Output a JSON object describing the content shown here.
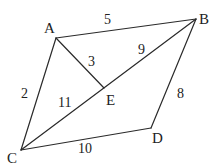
{
  "diagram": {
    "type": "geometry",
    "points": {
      "A": {
        "label": "A",
        "x": 56,
        "y": 38,
        "lx": 44,
        "ly": 33
      },
      "B": {
        "label": "B",
        "x": 196,
        "y": 19,
        "lx": 199,
        "ly": 24
      },
      "C": {
        "label": "C",
        "x": 21,
        "y": 150,
        "lx": 7,
        "ly": 163
      },
      "D": {
        "label": "D",
        "x": 151,
        "y": 128,
        "lx": 152,
        "ly": 143
      },
      "E": {
        "label": "E",
        "x": 104,
        "y": 88,
        "lx": 106,
        "ly": 105
      }
    },
    "edges": [
      {
        "from": "A",
        "to": "B",
        "length": "5",
        "lx": 104,
        "ly": 24
      },
      {
        "from": "A",
        "to": "C",
        "length": "2",
        "lx": 21,
        "ly": 98
      },
      {
        "from": "A",
        "to": "E",
        "length": "3",
        "lx": 88,
        "ly": 66
      },
      {
        "from": "B",
        "to": "E",
        "length": "9",
        "lx": 138,
        "ly": 54
      },
      {
        "from": "C",
        "to": "E",
        "length": "11",
        "lx": 58,
        "ly": 107
      },
      {
        "from": "B",
        "to": "D",
        "length": "8",
        "lx": 177,
        "ly": 98
      },
      {
        "from": "C",
        "to": "D",
        "length": "10",
        "lx": 78,
        "ly": 153
      }
    ]
  }
}
